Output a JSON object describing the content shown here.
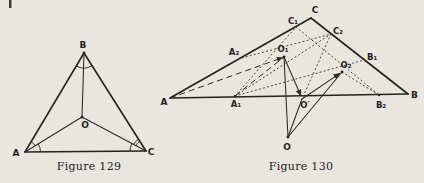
{
  "colors": {
    "background": "#e9e6e0",
    "ink": "#26231f"
  },
  "figure129": {
    "caption": "Figure 129",
    "labels": {
      "A": "A",
      "B": "B",
      "C": "C",
      "O": "O"
    }
  },
  "figure130": {
    "caption": "Figure 130",
    "labels": {
      "A": "A",
      "B": "B",
      "C": "C",
      "A1": "A₁",
      "A2": "A₂",
      "B1": "B₁",
      "B2": "B₂",
      "C1": "C₁",
      "C2": "C₂",
      "O": "O",
      "O1": "O₁",
      "O2": "O₂",
      "Oprime": "O′"
    }
  }
}
